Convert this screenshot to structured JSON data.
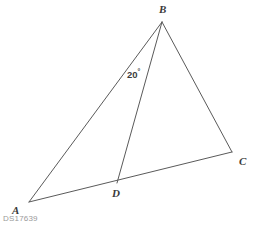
{
  "diagram": {
    "type": "geometry-triangle",
    "background_color": "#ffffff",
    "stroke_color": "#5a5a5a",
    "stroke_width": 1,
    "points": {
      "A": {
        "x": 29,
        "y": 202,
        "label": "A",
        "label_x": 12,
        "label_y": 205
      },
      "B": {
        "x": 162,
        "y": 22,
        "label": "B",
        "label_x": 159,
        "label_y": 4
      },
      "C": {
        "x": 232,
        "y": 152,
        "label": "C",
        "label_x": 239,
        "label_y": 156
      },
      "D": {
        "x": 117,
        "y": 183,
        "label": "D",
        "label_x": 112,
        "label_y": 188
      }
    },
    "segments": [
      {
        "name": "segment-AB",
        "from": "A",
        "to": "B"
      },
      {
        "name": "segment-BC",
        "from": "B",
        "to": "C"
      },
      {
        "name": "segment-AC",
        "from": "A",
        "to": "C"
      },
      {
        "name": "segment-BD",
        "from": "B",
        "to": "D"
      }
    ],
    "angles": [
      {
        "name": "angle-ABD",
        "value": "20",
        "unit": "°",
        "text": "20°",
        "x": 127,
        "y": 68
      }
    ]
  },
  "watermark": {
    "text": "DS17639",
    "color": "#9a9a9a"
  }
}
